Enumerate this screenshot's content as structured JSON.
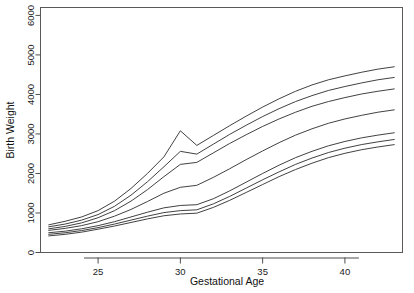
{
  "chart_data": {
    "type": "line",
    "title": "",
    "xlabel": "Gestational Age",
    "ylabel": "Birth Weight",
    "xlim": [
      21.5,
      43.5
    ],
    "ylim": [
      0,
      6200
    ],
    "xticks": [
      25,
      30,
      35,
      40
    ],
    "yticks": [
      0,
      1000,
      2000,
      3000,
      4000,
      5000,
      6000
    ],
    "xtick_labels": [
      "25",
      "30",
      "35",
      "40"
    ],
    "ytick_labels": [
      "0",
      "1000",
      "2000",
      "3000",
      "4000",
      "5000",
      "6000"
    ],
    "grid": false,
    "legend": "none",
    "x": [
      22,
      23,
      24,
      25,
      26,
      27,
      28,
      29,
      30,
      31,
      32,
      33,
      34,
      35,
      36,
      37,
      38,
      39,
      40,
      41,
      42,
      43
    ],
    "series": [
      {
        "name": "percentile-97",
        "values": [
          700,
          790,
          900,
          1060,
          1300,
          1620,
          2000,
          2420,
          3080,
          2710,
          2960,
          3210,
          3450,
          3680,
          3890,
          4080,
          4240,
          4370,
          4470,
          4560,
          4640,
          4700
        ]
      },
      {
        "name": "percentile-90",
        "values": [
          650,
          720,
          820,
          960,
          1170,
          1450,
          1790,
          2170,
          2560,
          2490,
          2740,
          2990,
          3220,
          3440,
          3640,
          3820,
          3970,
          4100,
          4200,
          4290,
          4370,
          4430
        ]
      },
      {
        "name": "percentile-75",
        "values": [
          600,
          660,
          750,
          880,
          1060,
          1300,
          1590,
          1920,
          2230,
          2280,
          2520,
          2760,
          2980,
          3190,
          3380,
          3550,
          3700,
          3820,
          3920,
          4010,
          4080,
          4140
        ]
      },
      {
        "name": "percentile-50",
        "values": [
          560,
          610,
          680,
          780,
          920,
          1090,
          1290,
          1500,
          1650,
          1700,
          1900,
          2120,
          2350,
          2570,
          2780,
          2970,
          3130,
          3270,
          3380,
          3470,
          3550,
          3610
        ]
      },
      {
        "name": "percentile-25",
        "values": [
          500,
          540,
          600,
          680,
          780,
          900,
          1020,
          1130,
          1190,
          1210,
          1360,
          1560,
          1780,
          2000,
          2210,
          2400,
          2560,
          2700,
          2810,
          2900,
          2970,
          3030
        ]
      },
      {
        "name": "percentile-10",
        "values": [
          460,
          500,
          555,
          630,
          720,
          820,
          920,
          1010,
          1060,
          1080,
          1230,
          1420,
          1630,
          1840,
          2040,
          2230,
          2390,
          2530,
          2640,
          2730,
          2800,
          2860
        ]
      },
      {
        "name": "percentile-03",
        "values": [
          420,
          460,
          515,
          590,
          670,
          760,
          850,
          930,
          975,
          995,
          1140,
          1320,
          1520,
          1720,
          1920,
          2100,
          2260,
          2400,
          2510,
          2600,
          2670,
          2730
        ]
      }
    ]
  }
}
